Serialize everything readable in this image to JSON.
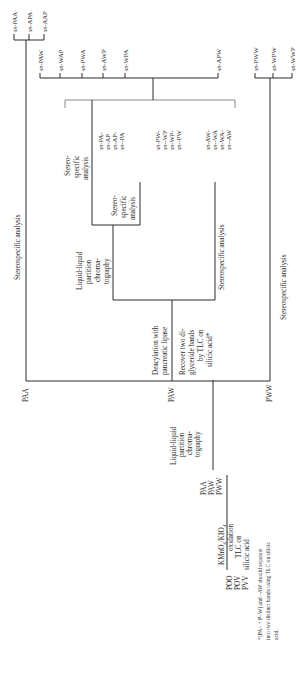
{
  "diagram": {
    "orientation": "rotated-90-ccw",
    "start": {
      "compounds": [
        "POO",
        "POV",
        "PVV"
      ],
      "step1_label": [
        "KMnO",
        "4",
        "/KIO",
        "4",
        " oxidation"
      ],
      "step1_below": [
        "TLC on",
        "silicic acid"
      ]
    },
    "intermediates": [
      "PAA",
      "PAW",
      "PWW"
    ],
    "lipid_partition_1": [
      "Liquid-liquid",
      "partition",
      "chroma-",
      "tography"
    ],
    "branch_labels": {
      "paa": "PAA",
      "paw": "PAW",
      "pww": "PWW"
    },
    "paa_branch": {
      "step": "Stereospecific analysis",
      "prefix": "sn",
      "products": [
        "-PAA",
        "-APA",
        "-AAP"
      ]
    },
    "paw_branch": {
      "step_above": [
        "Deacylation with",
        "pancreatic lipase"
      ],
      "step_below": [
        "Recover two di-",
        "glyceride bands",
        "by TLC on",
        "silicic acid*"
      ],
      "upper": {
        "partition": [
          "Liquid-liquid",
          "partition",
          "chroma-",
          "tography"
        ],
        "stereo_a": [
          "Stereo-",
          "specific",
          "analysis"
        ],
        "stereo_b": [
          "Stereo-",
          "specific",
          "analysis"
        ],
        "group_a": [
          "-PA-",
          "-AP",
          "-AP-",
          "--PA"
        ],
        "group_b": [
          "-PW-",
          "--WP",
          "-WP-",
          "--PW"
        ]
      },
      "lower": {
        "stereo": "Stereospecific analysis",
        "group_c": [
          "-AW-",
          "--WA",
          "-WA-",
          "--AW"
        ]
      },
      "products": [
        "-PAW",
        "-WAP",
        "-PWA",
        "-AWP",
        "-WPA",
        "-APW"
      ]
    },
    "pww_branch": {
      "step": "Stereospecific analysis",
      "products": [
        "-PWW",
        "-WPW",
        "-WWP"
      ]
    },
    "footnote": [
      "*[PA– + P–W] and –AW should separate",
      "into two distinct bands using TLC on silicic",
      "acid."
    ]
  }
}
